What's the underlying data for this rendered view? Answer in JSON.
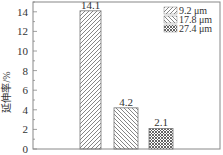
{
  "chart_data": {
    "type": "bar",
    "title": "",
    "xlabel": "",
    "ylabel": "延伸率/%",
    "ylim": [
      0,
      15
    ],
    "yticks": [
      0,
      2,
      4,
      6,
      8,
      10,
      12,
      14
    ],
    "grid": false,
    "legend_position": "top-right",
    "series": [
      {
        "name": "9.2 μm",
        "value": 14.1,
        "label": "14.1",
        "pattern": "hatch-forward"
      },
      {
        "name": "17.8 μm",
        "value": 4.2,
        "label": "4.2",
        "pattern": "hatch-backward"
      },
      {
        "name": "27.4 μm",
        "value": 2.1,
        "label": "2.1",
        "pattern": "crosshatch"
      }
    ]
  }
}
